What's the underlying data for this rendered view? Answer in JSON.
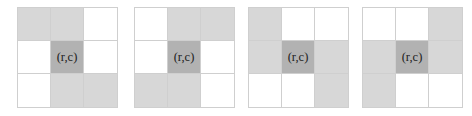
{
  "figure": {
    "background_color": "#ffffff",
    "width": 472,
    "height": 116,
    "center_label": "(r,c)",
    "colors": {
      "white": "#ffffff",
      "shaded": "#d7d7d7",
      "center": "#b2b2b2",
      "gridline": "#cfcfcf",
      "label_text": "#1c1c1c"
    }
  },
  "grids": [
    {
      "name": "grid-1",
      "left": 17,
      "top": 7,
      "size": 101,
      "center_label": "(r,c)",
      "cells": [
        [
          {
            "state": "shaded",
            "label": ""
          },
          {
            "state": "shaded",
            "label": ""
          },
          {
            "state": "white",
            "label": ""
          }
        ],
        [
          {
            "state": "white",
            "label": ""
          },
          {
            "state": "center",
            "label": "(r,c)"
          },
          {
            "state": "white",
            "label": ""
          }
        ],
        [
          {
            "state": "white",
            "label": ""
          },
          {
            "state": "shaded",
            "label": ""
          },
          {
            "state": "shaded",
            "label": ""
          }
        ]
      ]
    },
    {
      "name": "grid-2",
      "left": 134,
      "top": 7,
      "size": 101,
      "center_label": "(r,c)",
      "cells": [
        [
          {
            "state": "white",
            "label": ""
          },
          {
            "state": "shaded",
            "label": ""
          },
          {
            "state": "shaded",
            "label": ""
          }
        ],
        [
          {
            "state": "white",
            "label": ""
          },
          {
            "state": "center",
            "label": "(r,c)"
          },
          {
            "state": "white",
            "label": ""
          }
        ],
        [
          {
            "state": "shaded",
            "label": ""
          },
          {
            "state": "shaded",
            "label": ""
          },
          {
            "state": "white",
            "label": ""
          }
        ]
      ]
    },
    {
      "name": "grid-3",
      "left": 248,
      "top": 7,
      "size": 101,
      "center_label": "(r,c)",
      "cells": [
        [
          {
            "state": "shaded",
            "label": ""
          },
          {
            "state": "white",
            "label": ""
          },
          {
            "state": "white",
            "label": ""
          }
        ],
        [
          {
            "state": "shaded",
            "label": ""
          },
          {
            "state": "center",
            "label": "(r,c)"
          },
          {
            "state": "shaded",
            "label": ""
          }
        ],
        [
          {
            "state": "white",
            "label": ""
          },
          {
            "state": "white",
            "label": ""
          },
          {
            "state": "shaded",
            "label": ""
          }
        ]
      ]
    },
    {
      "name": "grid-4",
      "left": 362,
      "top": 7,
      "size": 101,
      "center_label": "(r,c)",
      "cells": [
        [
          {
            "state": "white",
            "label": ""
          },
          {
            "state": "white",
            "label": ""
          },
          {
            "state": "shaded",
            "label": ""
          }
        ],
        [
          {
            "state": "shaded",
            "label": ""
          },
          {
            "state": "center",
            "label": "(r,c)"
          },
          {
            "state": "shaded",
            "label": ""
          }
        ],
        [
          {
            "state": "shaded",
            "label": ""
          },
          {
            "state": "white",
            "label": ""
          },
          {
            "state": "white",
            "label": ""
          }
        ]
      ]
    }
  ]
}
